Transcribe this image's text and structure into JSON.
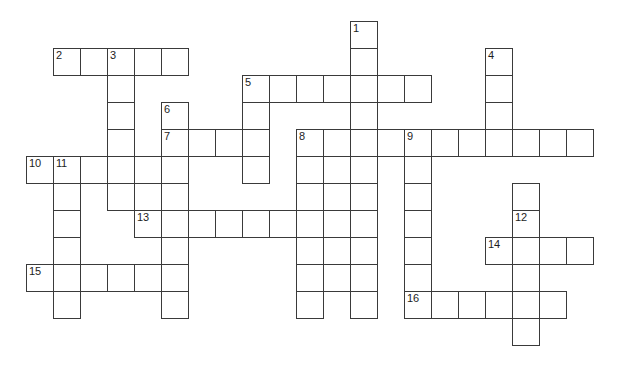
{
  "puzzle": {
    "type": "crossword-grid",
    "title": "Crossword puzzle grid",
    "canvas": {
      "width": 631,
      "height": 388,
      "background": "#ffffff"
    },
    "geometry": {
      "cell_size": 27,
      "origin_x": 26,
      "origin_y": 21,
      "cell_border_color": "#3a3a3a",
      "cell_fill_color": "#ffffff",
      "number_color": "#1d1d1d",
      "number_font_size": 11
    },
    "counts": {
      "numbered_clues": 16,
      "total_cells": 122,
      "across_entries": 9,
      "down_entries": 7
    },
    "numbers": [
      {
        "label": "1",
        "col": 12,
        "row": 0
      },
      {
        "label": "2",
        "col": 1,
        "row": 1
      },
      {
        "label": "3",
        "col": 3,
        "row": 1
      },
      {
        "label": "4",
        "col": 17,
        "row": 1
      },
      {
        "label": "5",
        "col": 8,
        "row": 2
      },
      {
        "label": "6",
        "col": 5,
        "row": 3
      },
      {
        "label": "7",
        "col": 5,
        "row": 4
      },
      {
        "label": "8",
        "col": 10,
        "row": 4
      },
      {
        "label": "9",
        "col": 14,
        "row": 4
      },
      {
        "label": "10",
        "col": 0,
        "row": 5
      },
      {
        "label": "11",
        "col": 1,
        "row": 5
      },
      {
        "label": "12",
        "col": 18,
        "row": 7
      },
      {
        "label": "13",
        "col": 4,
        "row": 7
      },
      {
        "label": "14",
        "col": 17,
        "row": 8
      },
      {
        "label": "15",
        "col": 0,
        "row": 9
      },
      {
        "label": "16",
        "col": 14,
        "row": 10
      }
    ],
    "entries": [
      {
        "number": "1",
        "direction": "down",
        "col": 12,
        "row": 0,
        "length": 5
      },
      {
        "number": "2",
        "direction": "across",
        "col": 1,
        "row": 1,
        "length": 5
      },
      {
        "number": "3",
        "direction": "down",
        "col": 3,
        "row": 1,
        "length": 7
      },
      {
        "number": "4",
        "direction": "down",
        "col": 17,
        "row": 1,
        "length": 4
      },
      {
        "number": "5",
        "direction": "across",
        "col": 8,
        "row": 2,
        "length": 7
      },
      {
        "number": "6",
        "direction": "down",
        "col": 5,
        "row": 3,
        "length": 6
      },
      {
        "number": "7",
        "direction": "across",
        "col": 5,
        "row": 4,
        "length": 4
      },
      {
        "number": "8",
        "direction": "down",
        "col": 10,
        "row": 4,
        "length": 8
      },
      {
        "number": "9",
        "direction": "across",
        "col": 14,
        "row": 4,
        "length": 7
      },
      {
        "number": "9b",
        "direction": "down",
        "col": 14,
        "row": 4,
        "length": 7
      },
      {
        "number": "10",
        "direction": "across",
        "col": 0,
        "row": 5,
        "length": 5
      },
      {
        "number": "11",
        "direction": "down",
        "col": 1,
        "row": 5,
        "length": 6
      },
      {
        "number": "12",
        "direction": "down",
        "col": 18,
        "row": 7,
        "length": 6
      },
      {
        "number": "13",
        "direction": "across",
        "col": 4,
        "row": 7,
        "length": 9
      },
      {
        "number": "14",
        "direction": "across",
        "col": 17,
        "row": 8,
        "length": 4
      },
      {
        "number": "15",
        "direction": "across",
        "col": 0,
        "row": 9,
        "length": 5
      },
      {
        "number": "16",
        "direction": "across",
        "col": 14,
        "row": 10,
        "length": 6
      }
    ],
    "cells": [
      [
        12,
        0
      ],
      [
        1,
        1
      ],
      [
        2,
        1
      ],
      [
        3,
        1
      ],
      [
        4,
        1
      ],
      [
        5,
        1
      ],
      [
        17,
        1
      ],
      [
        12,
        1
      ],
      [
        8,
        2
      ],
      [
        9,
        2
      ],
      [
        10,
        2
      ],
      [
        11,
        2
      ],
      [
        12,
        2
      ],
      [
        13,
        2
      ],
      [
        14,
        2
      ],
      [
        17,
        2
      ],
      [
        3,
        2
      ],
      [
        3,
        3
      ],
      [
        5,
        3
      ],
      [
        8,
        3
      ],
      [
        12,
        3
      ],
      [
        17,
        3
      ],
      [
        5,
        4
      ],
      [
        6,
        4
      ],
      [
        7,
        4
      ],
      [
        8,
        4
      ],
      [
        3,
        4
      ],
      [
        10,
        4
      ],
      [
        11,
        4
      ],
      [
        12,
        4
      ],
      [
        13,
        4
      ],
      [
        14,
        4
      ],
      [
        15,
        4
      ],
      [
        16,
        4
      ],
      [
        17,
        4
      ],
      [
        18,
        4
      ],
      [
        19,
        4
      ],
      [
        20,
        4
      ],
      [
        0,
        5
      ],
      [
        1,
        5
      ],
      [
        2,
        5
      ],
      [
        3,
        5
      ],
      [
        4,
        5
      ],
      [
        5,
        5
      ],
      [
        8,
        5
      ],
      [
        10,
        5
      ],
      [
        11,
        5
      ],
      [
        12,
        5
      ],
      [
        14,
        5
      ],
      [
        1,
        6
      ],
      [
        3,
        6
      ],
      [
        5,
        6
      ],
      [
        10,
        6
      ],
      [
        11,
        6
      ],
      [
        12,
        6
      ],
      [
        14,
        6
      ],
      [
        18,
        6
      ],
      [
        4,
        7
      ],
      [
        5,
        7
      ],
      [
        6,
        7
      ],
      [
        7,
        7
      ],
      [
        8,
        7
      ],
      [
        9,
        7
      ],
      [
        10,
        7
      ],
      [
        11,
        7
      ],
      [
        12,
        7
      ],
      [
        1,
        7
      ],
      [
        14,
        7
      ],
      [
        18,
        7
      ],
      [
        1,
        8
      ],
      [
        5,
        8
      ],
      [
        10,
        8
      ],
      [
        11,
        8
      ],
      [
        12,
        8
      ],
      [
        14,
        8
      ],
      [
        17,
        8
      ],
      [
        18,
        8
      ],
      [
        19,
        8
      ],
      [
        20,
        8
      ],
      [
        0,
        9
      ],
      [
        1,
        9
      ],
      [
        2,
        9
      ],
      [
        3,
        9
      ],
      [
        4,
        9
      ],
      [
        5,
        9
      ],
      [
        10,
        9
      ],
      [
        11,
        9
      ],
      [
        12,
        9
      ],
      [
        14,
        9
      ],
      [
        18,
        9
      ],
      [
        1,
        10
      ],
      [
        5,
        10
      ],
      [
        10,
        10
      ],
      [
        12,
        10
      ],
      [
        14,
        10
      ],
      [
        15,
        10
      ],
      [
        16,
        10
      ],
      [
        17,
        10
      ],
      [
        18,
        10
      ],
      [
        19,
        10
      ],
      [
        18,
        11
      ]
    ]
  }
}
